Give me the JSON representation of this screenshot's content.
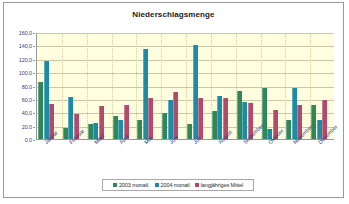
{
  "chart_data": {
    "type": "bar",
    "title": "Niederschlagsmenge",
    "xlabel": "",
    "ylabel": "",
    "ylim": [
      0,
      160
    ],
    "ytick_step": 20,
    "grid": true,
    "legend_position": "bottom",
    "categories": [
      "Januar",
      "Februar",
      "März",
      "April",
      "Mai",
      "Juni",
      "Juli",
      "August",
      "September",
      "Oktober",
      "November",
      "Dezember"
    ],
    "ytick_labels": [
      "0,0",
      "20,0",
      "40,0",
      "60,0",
      "80,0",
      "100,0",
      "120,0",
      "140,0",
      "160,0"
    ],
    "series": [
      {
        "name": "2003 monatl.",
        "color": "#2e8659",
        "values": [
          85,
          16,
          23,
          34,
          28,
          39,
          23,
          42,
          72,
          77,
          28,
          51
        ]
      },
      {
        "name": "2004 monatl",
        "color": "#1e8ba6",
        "values": [
          117,
          63,
          24,
          28,
          134,
          58,
          141,
          65,
          55,
          15,
          76,
          29
        ]
      },
      {
        "name": "langjähriges Mittel",
        "color": "#b34a6b",
        "values": [
          53,
          37,
          49,
          51,
          61,
          71,
          61,
          61,
          54,
          43,
          51,
          58
        ]
      }
    ]
  }
}
